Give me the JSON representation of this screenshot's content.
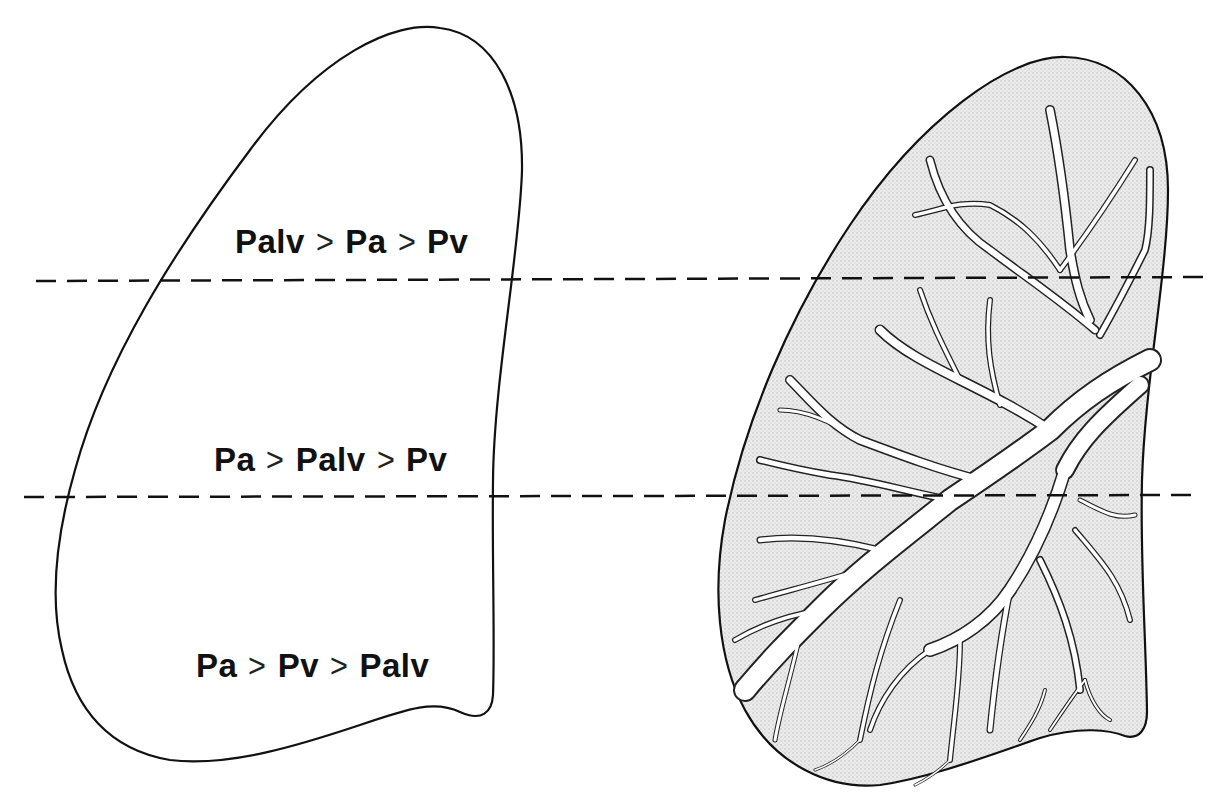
{
  "figure": {
    "colors": {
      "outline": "#111111",
      "lung_fill_right": "#e6e6e6",
      "vessel_fill": "#ffffff",
      "background": "#ffffff"
    },
    "zone_boundaries": [
      {
        "y": 281,
        "x1": 36,
        "x2": 1210
      },
      {
        "y": 497,
        "x1": 24,
        "x2": 1200
      }
    ],
    "left_lung": {
      "zones": [
        {
          "zone": 1,
          "parts": [
            "Palv",
            "Pa",
            "Pv"
          ],
          "operator": ">"
        },
        {
          "zone": 2,
          "parts": [
            "Pa",
            "Palv",
            "Pv"
          ],
          "operator": ">"
        },
        {
          "zone": 3,
          "parts": [
            "Pa",
            "Pv",
            "Palv"
          ],
          "operator": ">"
        }
      ]
    },
    "right_lung": {
      "description": "lung outline with pulmonary vascular tree"
    }
  }
}
